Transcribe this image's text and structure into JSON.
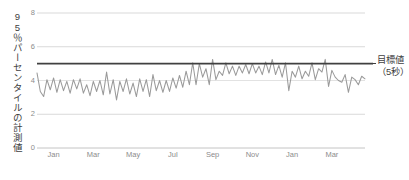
{
  "chart_data": {
    "type": "line",
    "title": "",
    "xlabel": "",
    "ylabel": "95％パーセンタイルの計測値",
    "ylim": [
      0,
      8
    ],
    "yticks": [
      0,
      2,
      4,
      6,
      8
    ],
    "ytick_labels": [
      "0",
      "2",
      "4",
      "6",
      "8"
    ],
    "grid": true,
    "grid_axis": "y",
    "legend_position": "right",
    "xtick_labels": [
      "Jan",
      "Mar",
      "May",
      "Jul",
      "Sep",
      "Nov",
      "Jan",
      "Mar"
    ],
    "xtick_positions": [
      5,
      17,
      29,
      41,
      53,
      65,
      77,
      89
    ],
    "x_count": 100,
    "series": [
      {
        "name": "95％パーセンタイルの計測値",
        "color": "#9a9a9a",
        "values": [
          4.45,
          3.35,
          3.05,
          4.05,
          3.45,
          4.15,
          3.3,
          4.05,
          3.4,
          3.95,
          3.25,
          4.05,
          3.5,
          4.1,
          3.25,
          3.75,
          3.1,
          3.95,
          3.35,
          4.0,
          3.15,
          4.5,
          3.2,
          4.05,
          2.85,
          3.95,
          3.35,
          4.1,
          3.2,
          3.85,
          3.05,
          4.1,
          3.35,
          4.05,
          3.05,
          4.35,
          3.4,
          4.0,
          3.3,
          4.0,
          3.35,
          4.15,
          3.55,
          4.3,
          3.6,
          4.55,
          3.75,
          5.05,
          3.75,
          5.0,
          4.2,
          4.7,
          3.75,
          5.25,
          4.05,
          4.55,
          4.3,
          5.05,
          4.4,
          4.85,
          4.3,
          4.85,
          4.45,
          4.95,
          4.4,
          5.0,
          4.45,
          4.85,
          4.35,
          5.1,
          4.45,
          5.25,
          4.35,
          4.9,
          4.2,
          5.05,
          3.4,
          4.55,
          4.2,
          4.85,
          4.1,
          4.55,
          4.25,
          5.05,
          4.05,
          4.7,
          4.5,
          5.25,
          3.65,
          4.6,
          4.2,
          4.0,
          3.9,
          4.35,
          3.3,
          4.2,
          4.05,
          3.75,
          4.25,
          4.1
        ]
      }
    ],
    "reference_line": {
      "name": "目標値",
      "label_line1": "目標値",
      "label_line2": "（5秒）",
      "value": 5,
      "color": "#404040"
    }
  },
  "colors": {
    "series_line": "#9a9a9a",
    "target_line": "#404040",
    "gridline": "#d9d9d9",
    "baseline": "#bfbfbf",
    "tick_text": "#8c8c8c",
    "axis_title_text": "#404040",
    "background": "#ffffff"
  }
}
